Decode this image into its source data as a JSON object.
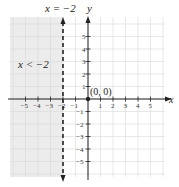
{
  "chart_data": {
    "type": "line",
    "title": "",
    "xlabel": "x",
    "ylabel": "y",
    "xlim": [
      -6,
      6
    ],
    "ylim": [
      -6,
      6
    ],
    "grid": true,
    "x_ticks": [
      -5,
      -4,
      -3,
      -2,
      -1,
      1,
      2,
      3,
      4,
      5
    ],
    "y_ticks": [
      5,
      4,
      3,
      2,
      1,
      -1,
      -2,
      -3,
      -4,
      -5
    ],
    "boundary_line": {
      "equation": "x = -2",
      "style": "dashed",
      "x": -2
    },
    "shaded_region": {
      "inequality": "x < -2",
      "side": "left"
    },
    "points": [
      {
        "label": "(0, 0)",
        "x": 0,
        "y": 0
      }
    ],
    "annotations": [
      "x = −2",
      "x < −2",
      "(0, 0)"
    ]
  },
  "labels": {
    "line_label": "x = −2",
    "region_label": "x < −2",
    "origin_label": "(0, 0)",
    "x_axis": "x",
    "y_axis": "y"
  },
  "colors": {
    "shade": "#ececec",
    "grid": "#d9d9d9",
    "axis": "#222222"
  }
}
